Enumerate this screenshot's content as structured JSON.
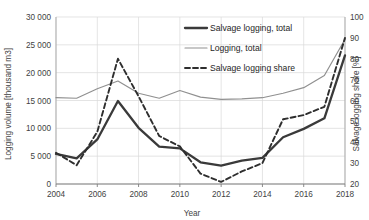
{
  "chart_data": {
    "type": "line",
    "title": "",
    "xlabel": "Year",
    "ylabel": "Logging volume [thousand m3]",
    "y2label": "Salvage logging share [%]",
    "x": [
      2004,
      2005,
      2006,
      2007,
      2008,
      2009,
      2010,
      2011,
      2012,
      2013,
      2014,
      2015,
      2016,
      2017,
      2018
    ],
    "xlim": [
      2004,
      2018
    ],
    "xticks": [
      2004,
      2006,
      2008,
      2010,
      2012,
      2014,
      2016,
      2018
    ],
    "xtick_labels": [
      "2004",
      "2006",
      "2008",
      "2010",
      "2012",
      "2014",
      "2016",
      "2018"
    ],
    "ylim": [
      0,
      30000
    ],
    "yticks": [
      0,
      5000,
      10000,
      15000,
      20000,
      25000,
      30000
    ],
    "ytick_labels": [
      "0",
      "5 000",
      "10 000",
      "15 000",
      "20 000",
      "25 000",
      "30 000"
    ],
    "y2lim": [
      20,
      100
    ],
    "y2ticks": [
      20,
      30,
      40,
      50,
      60,
      70,
      80,
      90,
      100
    ],
    "y2tick_labels": [
      "20",
      "30",
      "40",
      "50",
      "60",
      "70",
      "80",
      "90",
      "100"
    ],
    "grid": true,
    "legend_position": "top-center",
    "series": [
      {
        "name": "Salvage logging, total",
        "axis": "left",
        "style": "solid-thick",
        "color": "#3a3a3a",
        "values": [
          5400,
          4600,
          8000,
          14900,
          10100,
          6700,
          6400,
          3900,
          3300,
          4200,
          4700,
          8400,
          9900,
          11800,
          23100
        ]
      },
      {
        "name": "Logging, total",
        "axis": "left",
        "style": "solid-thin",
        "color": "#909090",
        "values": [
          15500,
          15400,
          17100,
          18500,
          16300,
          15400,
          16800,
          15600,
          15200,
          15300,
          15500,
          16300,
          17300,
          19500,
          26000
        ]
      },
      {
        "name": "Salvage logging share",
        "axis": "right",
        "style": "dashed",
        "color": "#2e2e2e",
        "values": [
          35,
          29,
          45,
          80,
          62,
          43,
          38,
          25,
          21,
          26,
          30,
          51,
          53,
          57,
          90
        ]
      }
    ]
  },
  "legend": {
    "items": [
      {
        "label": "Salvage logging, total"
      },
      {
        "label": "Logging, total"
      },
      {
        "label": "Salvage logging share"
      }
    ]
  }
}
